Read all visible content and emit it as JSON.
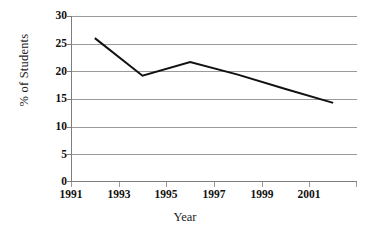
{
  "chart_data": {
    "type": "line",
    "title": "",
    "xlabel": "Year",
    "ylabel": "% of Students",
    "categories": [
      "1991",
      "1993",
      "1995",
      "1997",
      "1999",
      "2001"
    ],
    "x": [
      1991,
      1993,
      1995,
      1997,
      1999,
      2001
    ],
    "values": [
      26.0,
      19.2,
      21.7,
      19.4,
      16.8,
      14.3
    ],
    "series": [
      {
        "name": "% of Students",
        "values": [
          26.0,
          19.2,
          21.7,
          19.4,
          16.8,
          14.3
        ]
      }
    ],
    "ylim": [
      0,
      30
    ],
    "yticks": [
      0,
      5,
      10,
      15,
      20,
      25,
      30
    ],
    "ytick_labels": [
      "0",
      "5",
      "10",
      "15",
      "20",
      "25",
      "30"
    ],
    "xtick_labels": [
      "1991",
      "1993",
      "1995",
      "1997",
      "1999",
      "2001"
    ],
    "grid": "horizontal",
    "legend": "none",
    "line_color": "#111111",
    "grid_color": "#9a9a9a",
    "axis_color": "#7d7d7d",
    "background": "#ffffff"
  },
  "axis": {
    "y_title": "% of Students",
    "x_title": "Year",
    "y_ticks": [
      "30",
      "25",
      "20",
      "15",
      "10",
      "5",
      "0"
    ],
    "x_ticks": [
      "1991",
      "1993",
      "1995",
      "1997",
      "1999",
      "2001"
    ]
  }
}
